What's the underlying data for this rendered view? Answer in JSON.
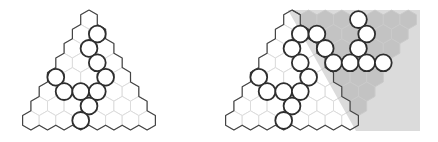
{
  "colors": {
    "background": "#ffffff",
    "hex_fill": "#ffffff",
    "hex_stroke": "#dcdcdc",
    "grey_fill": "#c9c9c9",
    "grey_stroke": "#dadada",
    "outline": "#444444",
    "piece_stroke": "#2e2e2e",
    "piece_fill": "#ffffff"
  },
  "geometry": {
    "hex_width": 16.6,
    "hex_radius": 9.6,
    "row_spacing": 14.4,
    "top_center_y": 19.6,
    "piece_radius": 8.4,
    "rows": 8
  },
  "figures": [
    {
      "name": "left-triangle-board",
      "apex_x": 89,
      "shape": "triangle",
      "pieces": [
        [
          1,
          1
        ],
        [
          2,
          1
        ],
        [
          3,
          2
        ],
        [
          4,
          0
        ],
        [
          4,
          3
        ],
        [
          5,
          1
        ],
        [
          5,
          2
        ],
        [
          5,
          3
        ],
        [
          6,
          3
        ],
        [
          7,
          3
        ]
      ]
    },
    {
      "name": "right-rhombus-board",
      "apex_x": 292,
      "shape": "rhombus",
      "shaded_wedge": [
        [
          288,
          10
        ],
        [
          420,
          10
        ],
        [
          420,
          131
        ],
        [
          356,
          131
        ]
      ],
      "pieces": [
        [
          1,
          1
        ],
        [
          2,
          1
        ],
        [
          3,
          2
        ],
        [
          4,
          0
        ],
        [
          4,
          3
        ],
        [
          5,
          1
        ],
        [
          5,
          2
        ],
        [
          5,
          3
        ],
        [
          6,
          3
        ],
        [
          7,
          3
        ],
        [
          0,
          4
        ],
        [
          1,
          2
        ],
        [
          1,
          5
        ],
        [
          2,
          3
        ],
        [
          2,
          5
        ],
        [
          3,
          4
        ],
        [
          3,
          5
        ],
        [
          3,
          6
        ],
        [
          3,
          7
        ]
      ]
    }
  ]
}
